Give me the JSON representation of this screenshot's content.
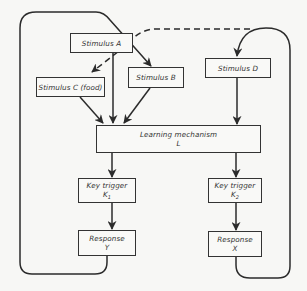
{
  "diagram": {
    "type": "flow-diagram",
    "colors": {
      "line": "#2b2b2b",
      "box_border": "#333333",
      "background": "#f7f7f5"
    },
    "nodes": {
      "stimulus_a": {
        "label": "Stimulus A"
      },
      "stimulus_b": {
        "label": "Stimulus B"
      },
      "stimulus_c": {
        "label": "Stimulus C (food)"
      },
      "stimulus_d": {
        "label": "Stimulus D"
      },
      "learning": {
        "label": "Learning mechanism",
        "symbol": "L"
      },
      "key_trigger_1": {
        "label": "Key trigger",
        "symbol": "K",
        "subscript": "1"
      },
      "key_trigger_2": {
        "label": "Key trigger",
        "symbol": "K",
        "subscript": "2"
      },
      "response_y": {
        "label": "Response",
        "symbol": "Y"
      },
      "response_x": {
        "label": "Response",
        "symbol": "X"
      }
    },
    "edges": [
      {
        "from": "stimulus_a",
        "to": "stimulus_c",
        "style": "dashed"
      },
      {
        "from": "stimulus_a",
        "to": "stimulus_d",
        "style": "dashed",
        "note": "dashed line connecting A toward D loop"
      },
      {
        "from": "stimulus_a",
        "to": "learning",
        "style": "solid"
      },
      {
        "from": "stimulus_b",
        "to": "learning",
        "style": "solid"
      },
      {
        "from": "stimulus_c",
        "to": "learning",
        "style": "solid"
      },
      {
        "from": "stimulus_d",
        "to": "learning",
        "style": "solid"
      },
      {
        "from": "learning",
        "to": "key_trigger_1",
        "style": "solid"
      },
      {
        "from": "learning",
        "to": "key_trigger_2",
        "style": "solid"
      },
      {
        "from": "key_trigger_1",
        "to": "response_y",
        "style": "solid"
      },
      {
        "from": "key_trigger_2",
        "to": "response_x",
        "style": "solid"
      },
      {
        "from": "response_y",
        "to": "stimulus_b",
        "style": "solid",
        "note": "feedback loop around left side"
      },
      {
        "from": "response_x",
        "to": "stimulus_d",
        "style": "solid",
        "note": "feedback loop around right side"
      }
    ]
  }
}
